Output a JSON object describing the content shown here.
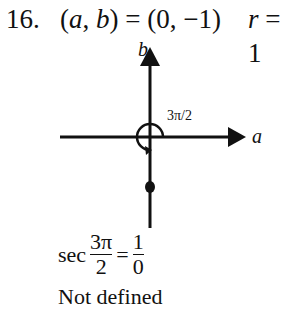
{
  "problem": {
    "number": "16.",
    "point_parts": {
      "a": "a",
      "comma": ", ",
      "b": "b",
      "equals": " = (0, −1)"
    },
    "radius": {
      "var": "r",
      "value": " = 1"
    }
  },
  "diagram": {
    "x_axis_label": "a",
    "y_axis_label": "b",
    "angle_label": "3π/2",
    "colors": {
      "line": "#111111"
    }
  },
  "equation": {
    "func": "sec",
    "arg_numerator": "3π",
    "arg_denominator": "2",
    "equals": "=",
    "value_numerator": "1",
    "value_denominator": "0"
  },
  "conclusion": "Not defined"
}
